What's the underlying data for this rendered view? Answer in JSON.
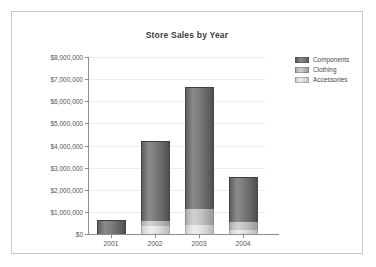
{
  "chart_data": {
    "type": "bar",
    "stacked": true,
    "title": "Store Sales by Year",
    "xlabel": "",
    "ylabel": "",
    "categories": [
      "2001",
      "2002",
      "2003",
      "2004"
    ],
    "series": [
      {
        "name": "Accessories",
        "color": "#e0e0e0",
        "values": [
          0,
          350000,
          400000,
          200000
        ]
      },
      {
        "name": "Clothing",
        "color": "#c0c0c0",
        "values": [
          0,
          230000,
          750000,
          350000
        ]
      },
      {
        "name": "Components",
        "color": "#6e6e6e",
        "values": [
          630000,
          3620000,
          5500000,
          2030000
        ]
      }
    ],
    "totals": [
      630000,
      4200000,
      6650000,
      2580000
    ],
    "ylim": [
      0,
      8000000
    ],
    "ytick_step": 1000000,
    "ytick_labels": [
      "$8,000,000",
      "$7,000,000",
      "$6,000,000",
      "$5,000,000",
      "$4,000,000",
      "$3,000,000",
      "$2,000,000",
      "$1,000,000",
      "$0"
    ],
    "ytick_values": [
      8000000,
      7000000,
      6000000,
      5000000,
      4000000,
      3000000,
      2000000,
      1000000,
      0
    ],
    "grid": true,
    "legend_position": "right",
    "legend": [
      {
        "label": "Components",
        "color": "#6e6e6e"
      },
      {
        "label": "Clothing",
        "color": "#c0c0c0"
      },
      {
        "label": "Accessories",
        "color": "#e0e0e0"
      }
    ]
  }
}
